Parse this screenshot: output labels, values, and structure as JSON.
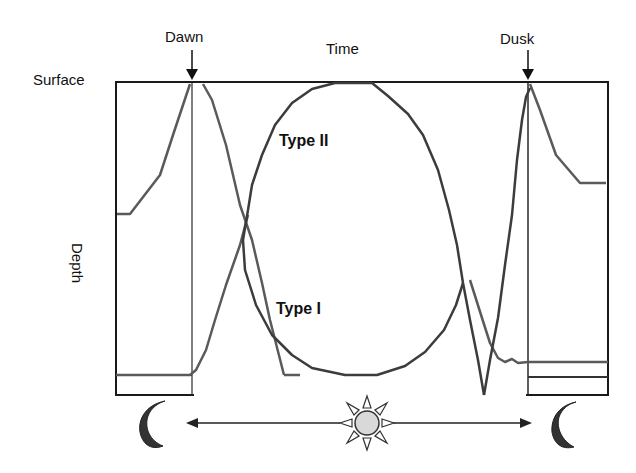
{
  "diagram": {
    "labels": {
      "dawn": "Dawn",
      "dusk": "Dusk",
      "time": "Time",
      "surface": "Surface",
      "depth": "Depth",
      "type_ii": "Type II",
      "type_i": "Type I"
    },
    "icons": {
      "left_moon": "moon-icon",
      "sun": "sun-icon",
      "right_moon": "moon-icon",
      "arrow": "double-headed-arrow"
    },
    "colors": {
      "frame": "#1a1a1a",
      "curve": "#555555",
      "moon": "#333333",
      "sun_fill": "#d9d9d9",
      "text": "#111111"
    },
    "curves": [
      {
        "name": "Type I",
        "description": "Surface at dawn and dusk, depth during day (normal migration)"
      },
      {
        "name": "Type II",
        "description": "Depth around dawn/dusk, surface at midday (reverse migration)"
      }
    ]
  },
  "background_bleed": [
    "identata) & Sergestes sp. (e.g. amphipods",
    "tical. For students, the aim of the field trip is to be",
    "s and methods used to make ecological process",
    "to plan a field study, conduct the survey, collect quali",
    "on data and finally compile the findings in a report.",
    "ter analysis provides details of how to analyse this"
  ]
}
